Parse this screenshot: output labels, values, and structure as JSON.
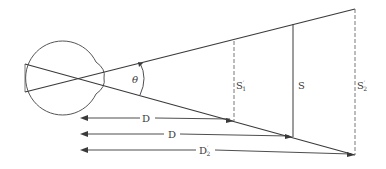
{
  "diagram": {
    "labels": {
      "theta": "θ",
      "s1_main": "S",
      "s1_prime": "′",
      "s1_sub": "1",
      "s": "S",
      "s2_main": "S",
      "s2_prime": "′",
      "s2_sub": "2",
      "d1": "D",
      "d": "D",
      "d2_main": "D",
      "d2_prime": "′",
      "d2_sub": "2"
    },
    "colors": {
      "line": "#3a3a3a",
      "dashed": "#6a6a6a",
      "eye": "#555555"
    }
  }
}
